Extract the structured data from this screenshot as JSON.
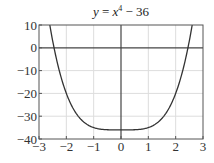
{
  "chart_data": {
    "type": "line",
    "title_parts": {
      "y": "y",
      "eq": " = ",
      "x": "x",
      "exp": "4",
      "rest": " − 36"
    },
    "xlabel": "",
    "ylabel": "",
    "xlim": [
      -3,
      3
    ],
    "ylim": [
      -40,
      10
    ],
    "xticks": [
      -3,
      -2,
      -1,
      0,
      1,
      2,
      3
    ],
    "xtick_labels": [
      "−3",
      "−2",
      "−1",
      "0",
      "1",
      "2",
      "3"
    ],
    "yticks": [
      10,
      0,
      -10,
      -20,
      -30,
      -40
    ],
    "ytick_labels": [
      "10",
      "0",
      "−10",
      "−20",
      "−30",
      "−40"
    ],
    "grid": true,
    "legend": null,
    "series": [
      {
        "name": "y = x^4 - 36",
        "function": "x^4 - 36",
        "x": [
          -2.6,
          -2.5,
          -2.4,
          -2.3,
          -2.2,
          -2.0,
          -1.8,
          -1.6,
          -1.4,
          -1.2,
          -1.0,
          -0.8,
          -0.6,
          -0.4,
          -0.2,
          0,
          0.2,
          0.4,
          0.6,
          0.8,
          1.0,
          1.2,
          1.4,
          1.6,
          1.8,
          2.0,
          2.2,
          2.3,
          2.4,
          2.5,
          2.6
        ],
        "values": [
          9.7,
          3.06,
          -2.82,
          -8.02,
          -12.57,
          -20.0,
          -25.5,
          -29.45,
          -32.16,
          -33.93,
          -35.0,
          -35.59,
          -35.87,
          -35.97,
          -36.0,
          -36.0,
          -36.0,
          -35.97,
          -35.87,
          -35.59,
          -35.0,
          -33.93,
          -32.16,
          -29.45,
          -25.5,
          -20.0,
          -12.57,
          -8.02,
          -2.82,
          3.06,
          9.7
        ]
      }
    ],
    "annotations": {
      "roots": [
        -2.449,
        2.449
      ],
      "minimum": {
        "x": 0,
        "y": -36
      }
    }
  },
  "colors": {
    "curve": "#333333",
    "axis": "#444444",
    "frame": "#555555",
    "grid": "#dddddd"
  }
}
